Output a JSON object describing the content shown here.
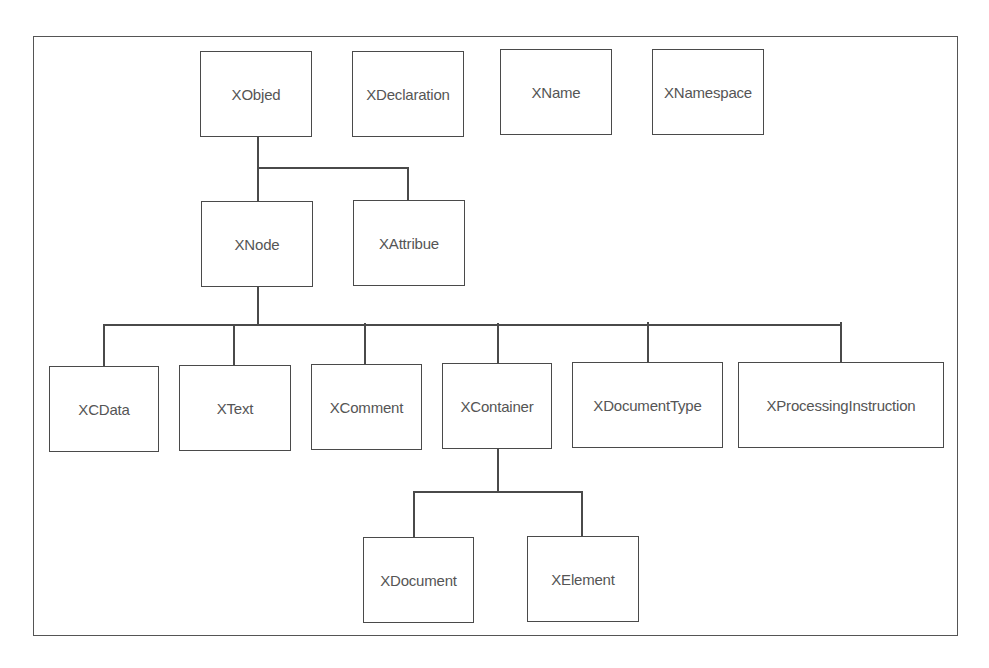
{
  "diagram": {
    "frame": {
      "x": 33,
      "y": 36,
      "w": 925,
      "h": 600
    },
    "line_color": "#4a4a4a",
    "text_color": "#555555",
    "nodes": [
      {
        "id": "xobject",
        "label": "XObjed",
        "x": 200,
        "y": 51,
        "w": 112,
        "h": 86
      },
      {
        "id": "xdeclaration",
        "label": "XDeclaration",
        "x": 352,
        "y": 51,
        "w": 112,
        "h": 86
      },
      {
        "id": "xname",
        "label": "XName",
        "x": 500,
        "y": 49,
        "w": 112,
        "h": 86
      },
      {
        "id": "xnamespace",
        "label": "XNamespace",
        "x": 652,
        "y": 49,
        "w": 112,
        "h": 86
      },
      {
        "id": "xnode",
        "label": "XNode",
        "x": 201,
        "y": 201,
        "w": 112,
        "h": 86
      },
      {
        "id": "xattribute",
        "label": "XAttribue",
        "x": 353,
        "y": 200,
        "w": 112,
        "h": 86
      },
      {
        "id": "xcdata",
        "label": "XCData",
        "x": 49,
        "y": 366,
        "w": 110,
        "h": 86
      },
      {
        "id": "xtext",
        "label": "XText",
        "x": 179,
        "y": 365,
        "w": 112,
        "h": 86
      },
      {
        "id": "xcomment",
        "label": "XComment",
        "x": 311,
        "y": 364,
        "w": 111,
        "h": 86
      },
      {
        "id": "xcontainer",
        "label": "XContainer",
        "x": 442,
        "y": 363,
        "w": 110,
        "h": 86
      },
      {
        "id": "xdocumenttype",
        "label": "XDocumentType",
        "x": 572,
        "y": 362,
        "w": 151,
        "h": 86
      },
      {
        "id": "xprocessinginstruction",
        "label": "XProcessingInstruction",
        "x": 738,
        "y": 362,
        "w": 206,
        "h": 86
      },
      {
        "id": "xdocument",
        "label": "XDocument",
        "x": 363,
        "y": 537,
        "w": 111,
        "h": 86
      },
      {
        "id": "xelement",
        "label": "XElement",
        "x": 527,
        "y": 536,
        "w": 112,
        "h": 86
      }
    ],
    "edges": [
      {
        "from": "xobject",
        "to": "xnode"
      },
      {
        "from": "xobject",
        "to": "xattribute"
      },
      {
        "from": "xnode",
        "to": "xcdata"
      },
      {
        "from": "xnode",
        "to": "xtext"
      },
      {
        "from": "xnode",
        "to": "xcomment"
      },
      {
        "from": "xnode",
        "to": "xcontainer"
      },
      {
        "from": "xnode",
        "to": "xdocumenttype"
      },
      {
        "from": "xnode",
        "to": "xprocessinginstruction"
      },
      {
        "from": "xcontainer",
        "to": "xdocument"
      },
      {
        "from": "xcontainer",
        "to": "xelement"
      }
    ],
    "connectors": [
      {
        "type": "v",
        "x": 257,
        "y": 137,
        "len": 64
      },
      {
        "type": "h",
        "x": 257,
        "y": 167,
        "len": 151
      },
      {
        "type": "v",
        "x": 407,
        "y": 167,
        "len": 33
      },
      {
        "type": "v",
        "x": 257,
        "y": 287,
        "len": 38
      },
      {
        "type": "h",
        "x": 103,
        "y": 324,
        "len": 738
      },
      {
        "type": "v",
        "x": 103,
        "y": 324,
        "len": 42
      },
      {
        "type": "v",
        "x": 233,
        "y": 324,
        "len": 41
      },
      {
        "type": "v",
        "x": 364,
        "y": 323,
        "len": 41
      },
      {
        "type": "v",
        "x": 497,
        "y": 323,
        "len": 40
      },
      {
        "type": "v",
        "x": 647,
        "y": 322,
        "len": 40
      },
      {
        "type": "v",
        "x": 840,
        "y": 322,
        "len": 40
      },
      {
        "type": "v",
        "x": 497,
        "y": 449,
        "len": 43
      },
      {
        "type": "h",
        "x": 413,
        "y": 491,
        "len": 169
      },
      {
        "type": "v",
        "x": 413,
        "y": 491,
        "len": 46
      },
      {
        "type": "v",
        "x": 581,
        "y": 491,
        "len": 45
      }
    ]
  }
}
